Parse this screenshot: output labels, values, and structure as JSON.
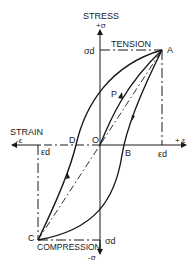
{
  "axes": {
    "y_title": "STRESS",
    "y_pos": "+σ",
    "y_neg": "-σ",
    "x_title": "STRAIN",
    "x_pos": "+ ε",
    "x_neg": "-ε"
  },
  "regions": {
    "top": "TENSION",
    "bottom": "COMPRESSION"
  },
  "limits": {
    "sigma_top": "σd",
    "sigma_bottom": "σd",
    "eps_right": "εd",
    "eps_left": "εd"
  },
  "points": {
    "A": "A",
    "B": "B",
    "C": "C",
    "D": "D",
    "O": "O",
    "P": "P"
  },
  "colors": {
    "ink": "#1a1a1a",
    "background": "#ffffff"
  }
}
